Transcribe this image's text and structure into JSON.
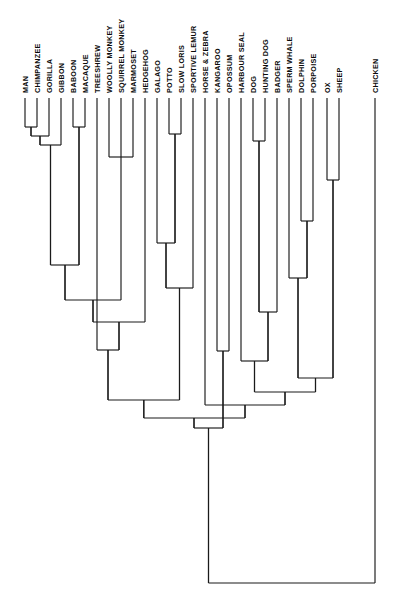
{
  "figure": {
    "type": "cladogram",
    "orientation": "tips-at-top, root-at-bottom",
    "line_color": "#1a1a1a",
    "background_color": "#ffffff",
    "label_color": "#0b0b0b",
    "label_orientation": "vertical-rotated-90ccw",
    "tip_count": 30
  },
  "chart_data": {
    "type": "tree",
    "xlabel": "",
    "ylabel": "",
    "grid": false,
    "legend": "none",
    "tip_count": 30,
    "tips": [
      {
        "index": 0,
        "label": "MAN",
        "x": 25,
        "tip_y": 98
      },
      {
        "index": 1,
        "label": "CHIMPANZEE",
        "x": 37,
        "tip_y": 98
      },
      {
        "index": 2,
        "label": "GORILLA",
        "x": 49,
        "tip_y": 98
      },
      {
        "index": 3,
        "label": "GIBBON",
        "x": 61,
        "tip_y": 98
      },
      {
        "index": 4,
        "label": "BABOON",
        "x": 73,
        "tip_y": 98
      },
      {
        "index": 5,
        "label": "MACAQUE",
        "x": 85,
        "tip_y": 98
      },
      {
        "index": 6,
        "label": "TREESHREW",
        "x": 97,
        "tip_y": 98
      },
      {
        "index": 7,
        "label": "WOOLLY MONKEY",
        "x": 109,
        "tip_y": 98
      },
      {
        "index": 8,
        "label": "SQUIRREL MONKEY",
        "x": 121,
        "tip_y": 98
      },
      {
        "index": 9,
        "label": "MARMOSET",
        "x": 133,
        "tip_y": 98
      },
      {
        "index": 10,
        "label": "HEDGEHOG",
        "x": 145,
        "tip_y": 98
      },
      {
        "index": 11,
        "label": "GALAGO",
        "x": 157,
        "tip_y": 98
      },
      {
        "index": 12,
        "label": "POTTO",
        "x": 169,
        "tip_y": 98
      },
      {
        "index": 13,
        "label": "SLOW LORIS",
        "x": 181,
        "tip_y": 98
      },
      {
        "index": 14,
        "label": "SPORTIVE LEMUR",
        "x": 193,
        "tip_y": 98
      },
      {
        "index": 15,
        "label": "HORSE & ZEBRA",
        "x": 205,
        "tip_y": 98
      },
      {
        "index": 16,
        "label": "KANGAROO",
        "x": 217,
        "tip_y": 98
      },
      {
        "index": 17,
        "label": "OPOSSUM",
        "x": 229,
        "tip_y": 98
      },
      {
        "index": 18,
        "label": "HARBOUR SEAL",
        "x": 241,
        "tip_y": 98
      },
      {
        "index": 19,
        "label": "DOG",
        "x": 253,
        "tip_y": 98
      },
      {
        "index": 20,
        "label": "HUNTING DOG",
        "x": 265,
        "tip_y": 98
      },
      {
        "index": 21,
        "label": "BADGER",
        "x": 277,
        "tip_y": 98
      },
      {
        "index": 22,
        "label": "SPERM WHALE",
        "x": 289,
        "tip_y": 98
      },
      {
        "index": 23,
        "label": "DOLPHIN",
        "x": 301,
        "tip_y": 98
      },
      {
        "index": 24,
        "label": "PORPOISE",
        "x": 313,
        "tip_y": 98
      },
      {
        "index": 25,
        "label": "OX",
        "x": 327,
        "tip_y": 98
      },
      {
        "index": 26,
        "label": "SHEEP",
        "x": 339,
        "tip_y": 98
      },
      {
        "index": 27,
        "label": "CHICKEN",
        "x": 375,
        "tip_y": 98
      }
    ],
    "nodes": [
      {
        "id": "n_man_chimp",
        "children_x": [
          25,
          37
        ],
        "y": 127,
        "x": 31,
        "members": [
          "MAN",
          "CHIMPANZEE"
        ]
      },
      {
        "id": "n_hominine",
        "children_x": [
          31,
          49
        ],
        "y": 136,
        "x": 40,
        "members": [
          "MAN",
          "CHIMPANZEE",
          "GORILLA"
        ]
      },
      {
        "id": "n_hominoid",
        "children_x": [
          40,
          61
        ],
        "y": 145,
        "x": 50.5,
        "members": [
          "MAN",
          "CHIMPANZEE",
          "GORILLA",
          "GIBBON"
        ]
      },
      {
        "id": "n_cercopith",
        "children_x": [
          73,
          85
        ],
        "y": 127,
        "x": 79,
        "members": [
          "BABOON",
          "MACAQUE"
        ]
      },
      {
        "id": "n_catarrhine",
        "children_x": [
          50.5,
          79
        ],
        "y": 265,
        "x": 65,
        "members": [
          "MAN",
          "CHIMPANZEE",
          "GORILLA",
          "GIBBON",
          "BABOON",
          "MACAQUE"
        ]
      },
      {
        "id": "n_platyrrhine",
        "children_x": [
          109,
          121,
          133
        ],
        "y": 157,
        "x": 121,
        "members": [
          "WOOLLY MONKEY",
          "SQUIRREL MONKEY",
          "MARMOSET"
        ]
      },
      {
        "id": "n_potto_loris",
        "children_x": [
          169,
          181
        ],
        "y": 134,
        "x": 175,
        "members": [
          "POTTO",
          "SLOW LORIS"
        ]
      },
      {
        "id": "n_lorisiform",
        "children_x": [
          157,
          175
        ],
        "y": 243,
        "x": 166,
        "members": [
          "GALAGO",
          "POTTO",
          "SLOW LORIS"
        ]
      },
      {
        "id": "n_strepsirrhine",
        "children_x": [
          166,
          193
        ],
        "y": 288,
        "x": 179.5,
        "members": [
          "GALAGO",
          "POTTO",
          "SLOW LORIS",
          "SPORTIVE LEMUR"
        ]
      },
      {
        "id": "n_anthropoid_plus",
        "children_x": [
          65,
          121
        ],
        "y": 300,
        "x": 93,
        "members": [
          "catarrhines",
          "platyrrhines"
        ]
      },
      {
        "id": "n_primate_hedgehog",
        "children_x": [
          93,
          145
        ],
        "y": 322,
        "x": 119,
        "members": [
          "primates",
          "HEDGEHOG"
        ]
      },
      {
        "id": "n_euarchonta",
        "children_x": [
          97,
          119
        ],
        "y": 350,
        "x": 108,
        "members": [
          "TREESHREW",
          "primates+hedgehog"
        ]
      },
      {
        "id": "n_primatomorpha",
        "children_x": [
          108,
          179.5
        ],
        "y": 400,
        "x": 143.8,
        "members": [
          "treeshrew clade",
          "strepsirrhines"
        ]
      },
      {
        "id": "n_marsupial",
        "children_x": [
          217,
          229
        ],
        "y": 351,
        "x": 223,
        "members": [
          "KANGAROO",
          "OPOSSUM"
        ]
      },
      {
        "id": "n_dog_huntingdog",
        "children_x": [
          253,
          265
        ],
        "y": 141,
        "x": 259,
        "members": [
          "DOG",
          "HUNTING DOG"
        ]
      },
      {
        "id": "n_caniform",
        "children_x": [
          259,
          277
        ],
        "y": 312,
        "x": 268,
        "members": [
          "DOG",
          "HUNTING DOG",
          "BADGER"
        ]
      },
      {
        "id": "n_carnivore",
        "children_x": [
          241,
          268
        ],
        "y": 361,
        "x": 254.5,
        "members": [
          "HARBOUR SEAL",
          "caniforms"
        ]
      },
      {
        "id": "n_delphinid",
        "children_x": [
          301,
          313
        ],
        "y": 221,
        "x": 307,
        "members": [
          "DOLPHIN",
          "PORPOISE"
        ]
      },
      {
        "id": "n_cetacean",
        "children_x": [
          289,
          307
        ],
        "y": 278,
        "x": 298,
        "members": [
          "SPERM WHALE",
          "DOLPHIN",
          "PORPOISE"
        ]
      },
      {
        "id": "n_bovid",
        "children_x": [
          327,
          339
        ],
        "y": 180,
        "x": 333,
        "members": [
          "OX",
          "SHEEP"
        ]
      },
      {
        "id": "n_cetartiodactyl",
        "children_x": [
          298,
          333
        ],
        "y": 378,
        "x": 315.5,
        "members": [
          "cetaceans",
          "bovids"
        ]
      },
      {
        "id": "n_ferungulate",
        "children_x": [
          254.5,
          315.5
        ],
        "y": 392,
        "x": 285,
        "members": [
          "carnivores",
          "cetartiodactyls"
        ]
      },
      {
        "id": "n_laurasiatheria",
        "children_x": [
          205,
          285
        ],
        "y": 405,
        "x": 245,
        "members": [
          "HORSE & ZEBRA",
          "ferungulates"
        ]
      },
      {
        "id": "n_placental",
        "children_x": [
          143.8,
          245
        ],
        "y": 418,
        "x": 194,
        "members": [
          "primatomorpha",
          "laurasiatheria"
        ]
      },
      {
        "id": "n_theria",
        "children_x": [
          194,
          223
        ],
        "y": 428,
        "x": 208.5,
        "members": [
          "placentals",
          "marsupials"
        ]
      },
      {
        "id": "n_root",
        "children_x": [
          208.5,
          375
        ],
        "y": 583,
        "x": 291.8,
        "members": [
          "mammals",
          "CHICKEN"
        ]
      }
    ]
  }
}
